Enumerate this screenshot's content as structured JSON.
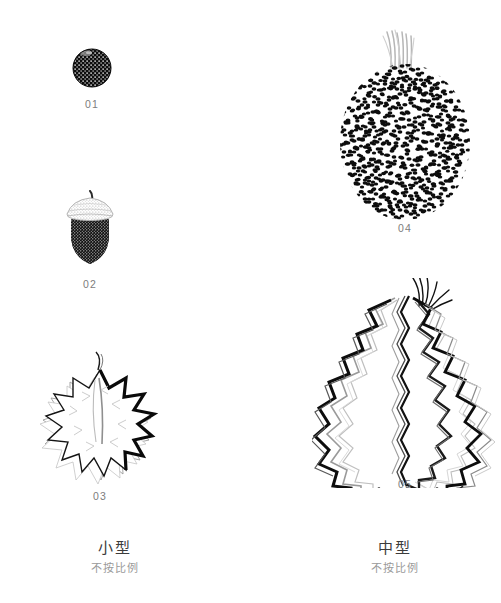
{
  "plate": {
    "background_color": "#ffffff",
    "label_color": "#7d7d7d",
    "caption_color": "#3b3b3b",
    "caption_sub_color": "#9a9a9a"
  },
  "figures": [
    {
      "id": "fig-01",
      "label": "01",
      "name": "round-berry-fruit",
      "description": "dark stippled round berry",
      "ink_color": "#111111",
      "x": 66,
      "y": 44,
      "w": 52,
      "h": 48
    },
    {
      "id": "fig-02",
      "label": "02",
      "name": "acorn-fruit",
      "description": "acorn with light textured cap and dark stippled body",
      "ink_color": "#111111",
      "x": 56,
      "y": 190,
      "w": 68,
      "h": 80
    },
    {
      "id": "fig-03",
      "label": "03",
      "name": "spiky-star-fruit",
      "description": "small spiky durian-like fruit outline",
      "ink_color": "#111111",
      "x": 36,
      "y": 352,
      "w": 128,
      "h": 130
    },
    {
      "id": "fig-04",
      "label": "04",
      "name": "jackfruit",
      "description": "large stippled oval fruit with grey fibrous stem",
      "ink_color": "#111111",
      "x": 330,
      "y": 28,
      "w": 150,
      "h": 190
    },
    {
      "id": "fig-05",
      "label": "05",
      "name": "durian-fruit",
      "description": "large durian with layered zigzag spiny outlines",
      "ink_color": "#111111",
      "x": 318,
      "y": 282,
      "w": 172,
      "h": 196
    }
  ],
  "columns": [
    {
      "id": "column-small",
      "title": "小型",
      "subtitle": "不按比例"
    },
    {
      "id": "column-medium",
      "title": "中型",
      "subtitle": "不按比例"
    }
  ]
}
